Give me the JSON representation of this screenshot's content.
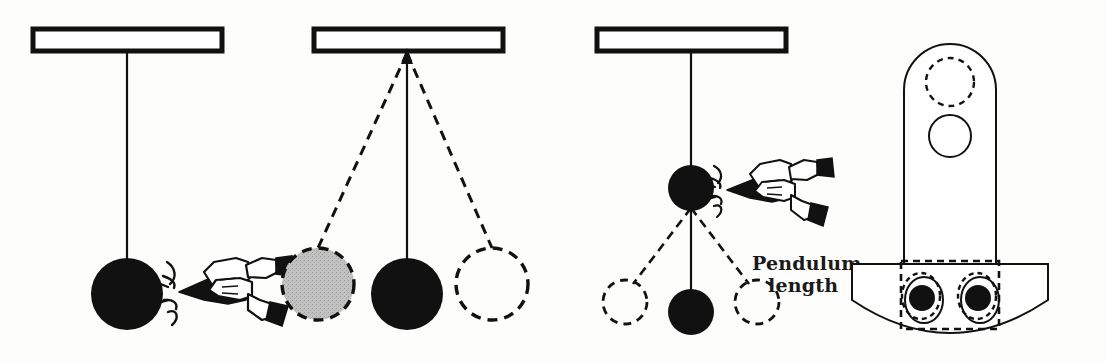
{
  "figure": {
    "background_color": "#fdfdfb",
    "ink_color": "#111111",
    "gray_fill_color": "#b6b6b6",
    "width": 1106,
    "height": 362
  },
  "annotations": {
    "pendulum_length_line1": "Pendulum",
    "pendulum_length_line2": "length"
  },
  "panels": [
    {
      "id": "panel-1",
      "name": "long-pendulum-at-rest-being-flicked",
      "support_bar": {
        "x": 33,
        "y": 29,
        "width": 189,
        "height": 22
      },
      "pivot": {
        "x": 127,
        "y": 51
      },
      "rod": {
        "x1": 127,
        "y1": 51,
        "x2": 127,
        "y2": 258
      },
      "bobs": [
        {
          "name": "bob-solid",
          "cx": 127,
          "cy": 294,
          "r": 36,
          "fill": "solid"
        }
      ],
      "hand": {
        "x": 170,
        "y": 258,
        "width": 110,
        "height": 78
      },
      "impact_lines": true
    },
    {
      "id": "panel-2",
      "name": "long-pendulum-swinging",
      "support_bar": {
        "x": 314,
        "y": 29,
        "width": 189,
        "height": 22
      },
      "pivot": {
        "x": 407,
        "y": 51
      },
      "rod": {
        "x1": 407,
        "y1": 51,
        "x2": 407,
        "y2": 258
      },
      "dashed_rods": [
        {
          "x1": 407,
          "y1": 51,
          "x2": 318,
          "y2": 248
        },
        {
          "x1": 407,
          "y1": 51,
          "x2": 492,
          "y2": 248
        }
      ],
      "pivot_arrow": true,
      "bobs": [
        {
          "name": "bob-gray-dashed",
          "cx": 318,
          "cy": 284,
          "r": 36,
          "fill": "gray-dashed"
        },
        {
          "name": "bob-solid",
          "cx": 407,
          "cy": 294,
          "r": 36,
          "fill": "solid"
        },
        {
          "name": "bob-outline-dashed",
          "cx": 492,
          "cy": 284,
          "r": 36,
          "fill": "outline-dashed"
        }
      ]
    },
    {
      "id": "panel-3",
      "name": "short-pendulum-being-flicked",
      "support_bar": {
        "x": 597,
        "y": 29,
        "width": 189,
        "height": 22
      },
      "pivot": {
        "x": 691,
        "y": 51
      },
      "rod": {
        "x1": 691,
        "y1": 51,
        "x2": 691,
        "y2": 166
      },
      "bobs": [
        {
          "name": "bob-pivot-solid",
          "cx": 691,
          "cy": 188,
          "r": 22,
          "fill": "solid"
        },
        {
          "name": "bob-lower-solid",
          "cx": 691,
          "cy": 312,
          "r": 22,
          "fill": "solid"
        },
        {
          "name": "bob-left-dashed",
          "cx": 625,
          "cy": 301,
          "r": 22,
          "fill": "outline-dashed"
        },
        {
          "name": "bob-right-dashed",
          "cx": 757,
          "cy": 301,
          "r": 22,
          "fill": "outline-dashed"
        }
      ],
      "lower_rod": {
        "x1": 691,
        "y1": 210,
        "x2": 691,
        "y2": 290
      },
      "dashed_rods": [
        {
          "x1": 691,
          "y1": 210,
          "x2": 633,
          "y2": 283
        },
        {
          "x1": 691,
          "y1": 210,
          "x2": 749,
          "y2": 283
        }
      ],
      "hand": {
        "x": 718,
        "y": 163,
        "width": 118,
        "height": 72
      },
      "impact_lines": true
    },
    {
      "id": "panel-4",
      "name": "metronome-weight-assembly",
      "stem": {
        "x": 904,
        "y": 43,
        "width": 93,
        "height": 222,
        "top_radius": 46
      },
      "circles": [
        {
          "name": "hole-upper-dashed",
          "cx": 950,
          "cy": 82,
          "r": 24,
          "fill": "outline-dashed"
        },
        {
          "name": "hole-lower-solid",
          "cx": 950,
          "cy": 135,
          "r": 21,
          "fill": "outline-solid"
        }
      ],
      "base": {
        "name": "half-disc-base",
        "x": 850,
        "y": 263,
        "width": 200,
        "height": 88
      },
      "base_holes": [
        {
          "name": "weight-left",
          "cx": 921,
          "cy": 298,
          "rx": 19,
          "ry": 23
        },
        {
          "name": "weight-right",
          "cx": 977,
          "cy": 298,
          "rx": 19,
          "ry": 23
        }
      ],
      "dashed_overlay_rect": {
        "x": 900,
        "y": 262,
        "width": 100,
        "height": 68
      }
    }
  ]
}
